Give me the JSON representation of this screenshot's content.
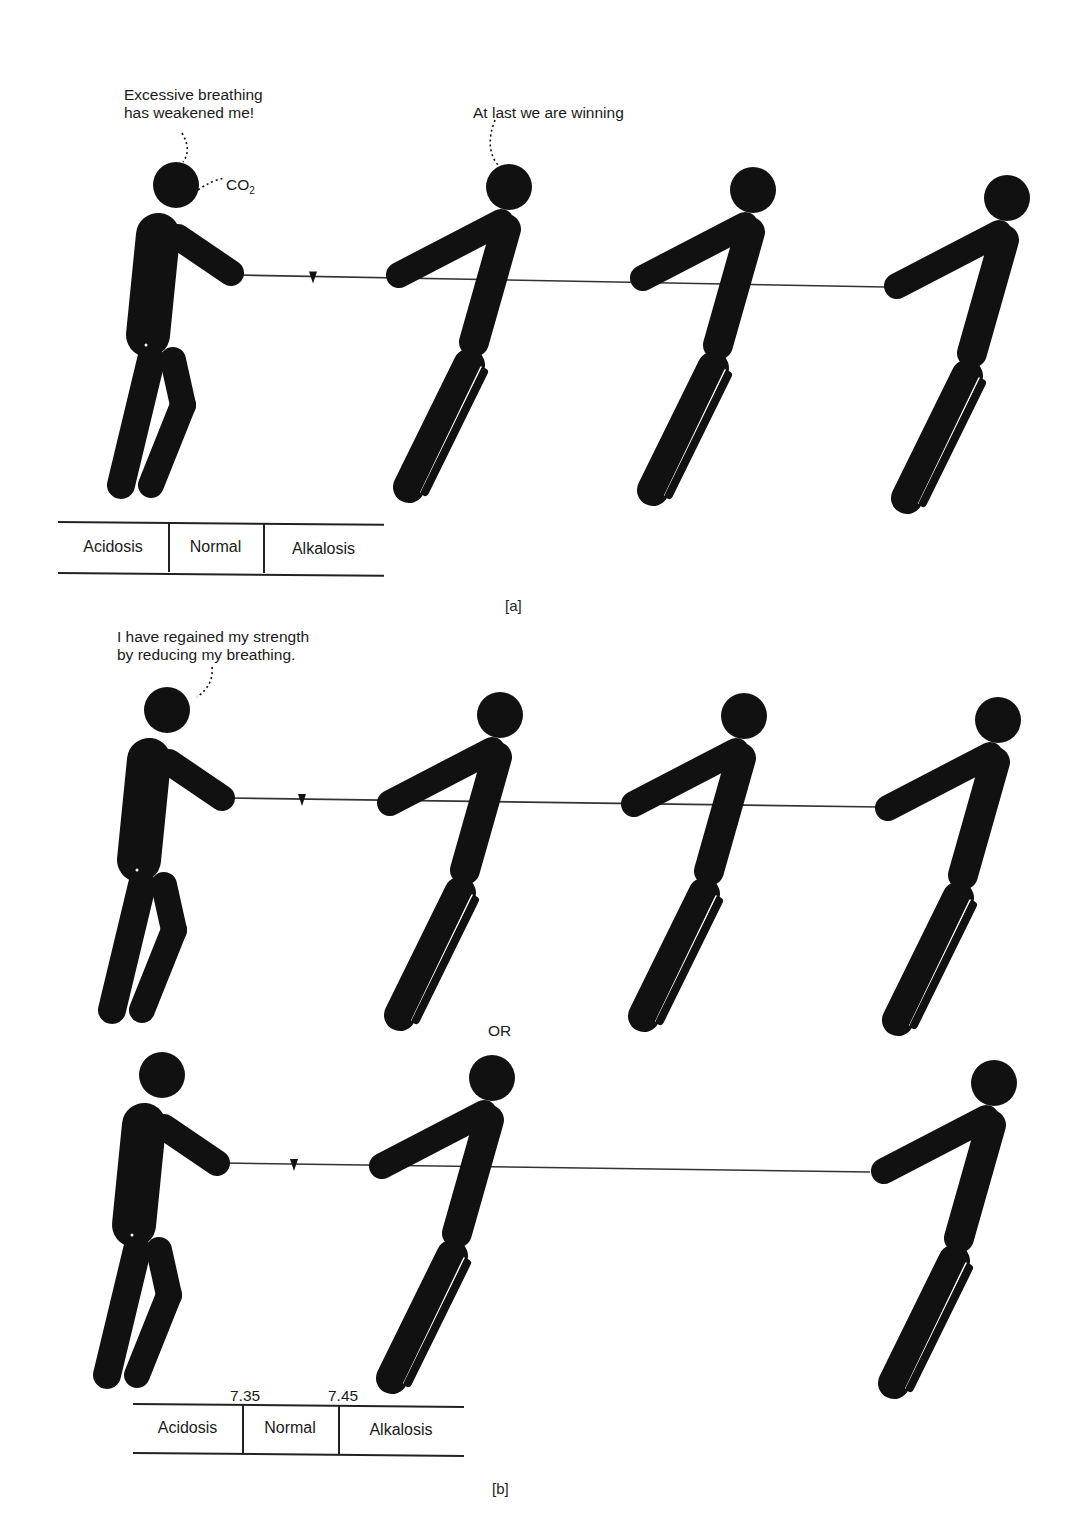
{
  "panel_a": {
    "caption": "[a]",
    "speech_weak": {
      "line1": "Excessive breathing",
      "line2": "has weakened me!"
    },
    "co2_label": "CO",
    "co2_subscript": "2",
    "speech_winning": "At last we are winning",
    "scale": {
      "left": "Acidosis",
      "middle": "Normal",
      "right": "Alkalosis"
    }
  },
  "panel_b": {
    "caption": "[b]",
    "speech_regained": {
      "line1": "I have regained my strength",
      "line2": "by reducing my breathing."
    },
    "or_label": "OR",
    "scale": {
      "left": "Acidosis",
      "middle": "Normal",
      "right": "Alkalosis",
      "tick_low": "7.35",
      "tick_high": "7.45"
    }
  },
  "colors": {
    "ink": "#111111",
    "background": "#ffffff",
    "rope": "#333333"
  },
  "scenes": [
    {
      "id": "a",
      "rope": {
        "x1": 236,
        "y1": 275,
        "x2": 885,
        "y2": 287
      },
      "marker_x": 313,
      "weak_figure": {
        "head_x": 176,
        "head_y": 185
      },
      "pullers": [
        {
          "head_x": 509,
          "head_y": 187
        },
        {
          "head_x": 753,
          "head_y": 190
        },
        {
          "head_x": 1007,
          "head_y": 198
        }
      ]
    },
    {
      "id": "b1",
      "rope": {
        "x1": 230,
        "y1": 798,
        "x2": 880,
        "y2": 807
      },
      "marker_x": 302,
      "weak_figure": {
        "head_x": 167,
        "head_y": 710
      },
      "pullers": [
        {
          "head_x": 500,
          "head_y": 715
        },
        {
          "head_x": 744,
          "head_y": 716
        },
        {
          "head_x": 998,
          "head_y": 720
        }
      ]
    },
    {
      "id": "b2",
      "rope": {
        "x1": 222,
        "y1": 1163,
        "x2": 870,
        "y2": 1172
      },
      "marker_x": 294,
      "weak_figure": {
        "head_x": 162,
        "head_y": 1075
      },
      "pullers": [
        {
          "head_x": 492,
          "head_y": 1078
        },
        {
          "head_x": 994,
          "head_y": 1083
        }
      ]
    }
  ]
}
